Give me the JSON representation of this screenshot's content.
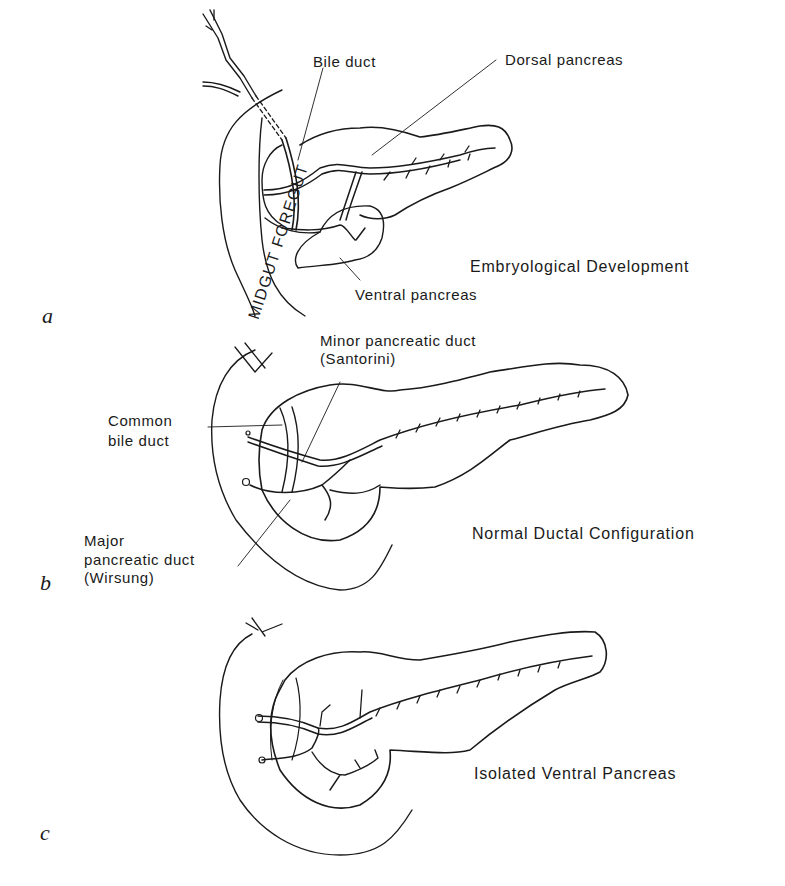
{
  "figure": {
    "panels": [
      {
        "letter": "a",
        "caption": "Embryological Development",
        "labels": {
          "bile_duct": "Bile duct",
          "dorsal_pancreas": "Dorsal pancreas",
          "ventral_pancreas": "Ventral pancreas",
          "gut": "MIDGUT FOREGUT"
        }
      },
      {
        "letter": "b",
        "caption": "Normal Ductal Configuration",
        "labels": {
          "minor_duct_line1": "Minor pancreatic duct",
          "minor_duct_line2": "(Santorini)",
          "common_bile_line1": "Common",
          "common_bile_line2": "bile duct",
          "major_duct_line1": "Major",
          "major_duct_line2": "pancreatic duct",
          "major_duct_line3": "(Wirsung)"
        }
      },
      {
        "letter": "c",
        "caption": "Isolated Ventral Pancreas"
      }
    ],
    "colors": {
      "ink": "#1a1a1a",
      "background": "#ffffff"
    }
  }
}
